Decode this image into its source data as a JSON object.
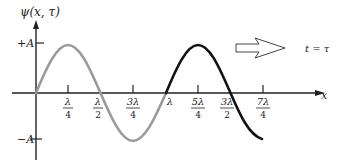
{
  "diagram": {
    "y_axis_label": "ψ(x, τ)",
    "x_axis_label": "x",
    "amplitude_pos_label": "+A",
    "amplitude_neg_label": "−A",
    "time_label": "t = τ",
    "ticks": [
      {
        "num": "λ",
        "den": "4"
      },
      {
        "num": "λ",
        "den": "2"
      },
      {
        "num": "3λ",
        "den": "4"
      },
      {
        "num": "λ",
        "den": ""
      },
      {
        "num": "5λ",
        "den": "4"
      },
      {
        "num": "3λ",
        "den": "2"
      },
      {
        "num": "7λ",
        "den": "4"
      }
    ],
    "colors": {
      "axis": "#222222",
      "wave_first_period": "#9a9a9a",
      "wave_second_part": "#111111",
      "arrow_outline": "#444444"
    },
    "arrow_direction": "right"
  }
}
